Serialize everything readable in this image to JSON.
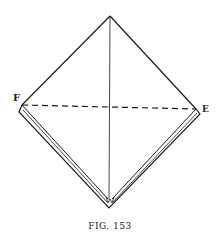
{
  "figure": {
    "caption": "FIG. 153",
    "labels": {
      "left_point": "F",
      "right_point": "E"
    },
    "points": {
      "top": [
        110,
        16
      ],
      "F": [
        22,
        105
      ],
      "E": [
        196,
        109
      ],
      "bottom": [
        109,
        208
      ]
    },
    "line_color": "#1a1a1a",
    "fold_line_style": "dashed"
  }
}
